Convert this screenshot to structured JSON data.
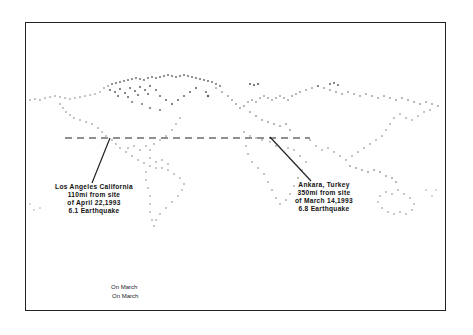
{
  "map": {
    "type": "world-outline",
    "style": "dotted coastlines, black and white scan",
    "reference_line": "dashed horizontal latitude line"
  },
  "annotations": [
    {
      "id": "los-angeles",
      "lines": [
        "Los Angeles California",
        "110mi from site",
        "of April 22,1993",
        "6.1 Earthquake"
      ]
    },
    {
      "id": "ankara",
      "lines": [
        "Ankara, Turkey",
        "350mi from site",
        "of March 14,1993",
        "6.8 Earthquake"
      ]
    }
  ],
  "footer_notes": [
    "On March",
    "On March"
  ],
  "colors": {
    "background": "#ffffff",
    "ink": "#111111",
    "coast_dots": "#555555"
  }
}
